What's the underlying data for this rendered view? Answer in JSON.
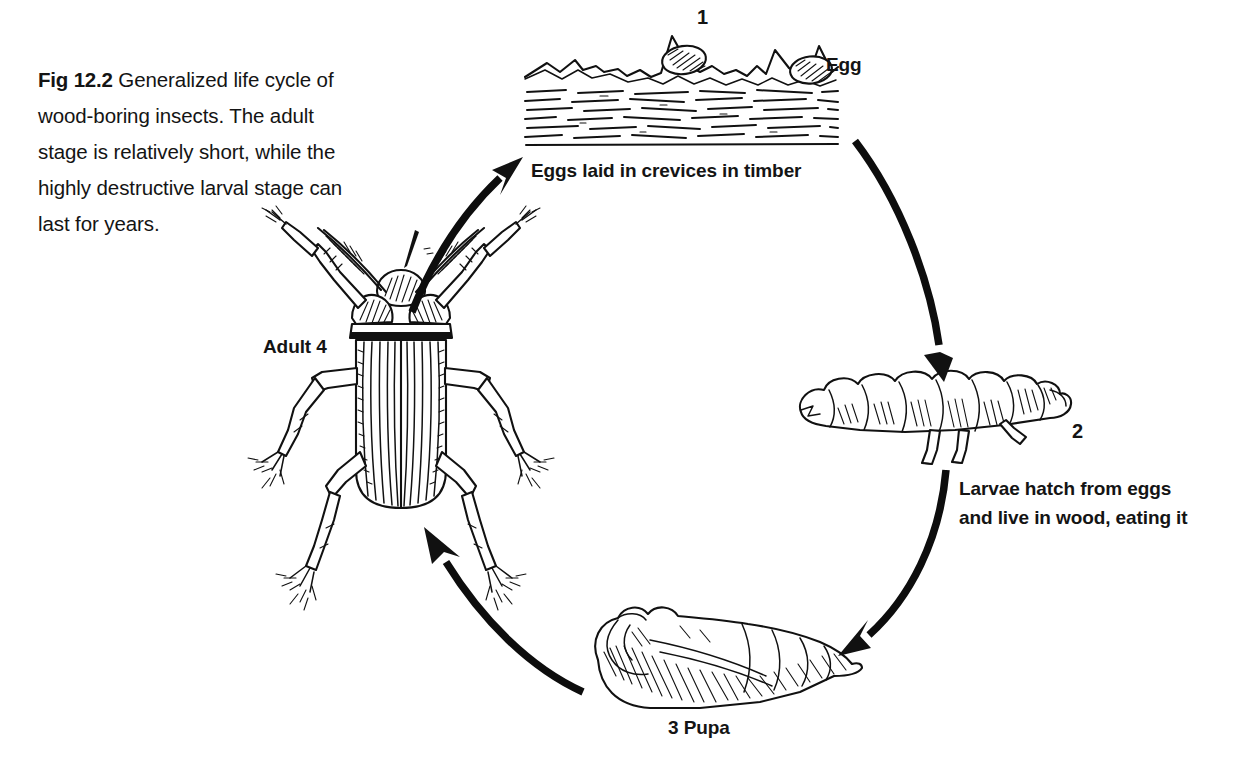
{
  "figure": {
    "caption_number": "Fig 12.2",
    "caption_text": "Generalized life cycle of wood-boring insects. The adult stage is relatively short, while the highly destructive larval stage can last for years.",
    "background_color": "#ffffff",
    "ink_color": "#111111",
    "title": "Generalized life cycle of wood-boring insects"
  },
  "diagram": {
    "type": "cycle",
    "stage_count": 4,
    "stages": [
      {
        "number": "1",
        "name": "Egg",
        "caption": "Eggs laid in crevices in timber",
        "position": "top",
        "illustration": "timber-block-with-eggs"
      },
      {
        "number": "2",
        "name": "Larva",
        "caption": "Larvae hatch from eggs and live in wood, eating it",
        "caption_line_1": "Larvae hatch from eggs",
        "caption_line_2": "and live in wood, eating it",
        "position": "right",
        "illustration": "larva-grub"
      },
      {
        "number": "3",
        "name": "Pupa",
        "caption": "3  Pupa",
        "position": "bottom",
        "illustration": "pupa"
      },
      {
        "number": "4",
        "name": "Adult",
        "caption": "Adult  4",
        "position": "left",
        "illustration": "adult-beetle"
      }
    ],
    "labels": {
      "egg": "Egg",
      "num_1": "1",
      "eggs_laid": "Eggs laid in crevices in timber",
      "num_2": "2",
      "larvae_line_1": "Larvae hatch from eggs",
      "larvae_line_2": "and live in wood, eating it",
      "pupa": "3   Pupa",
      "adult": "Adult   4"
    },
    "arrows": [
      {
        "name": "adult-to-egg",
        "from": "Adult",
        "to": "Egg",
        "direction": "up-right"
      },
      {
        "name": "egg-to-larva",
        "from": "Egg",
        "to": "Larva",
        "direction": "down-right"
      },
      {
        "name": "larva-to-pupa",
        "from": "Larva",
        "to": "Pupa",
        "direction": "down-left"
      },
      {
        "name": "pupa-to-adult",
        "from": "Pupa",
        "to": "Adult",
        "direction": "up-left"
      }
    ]
  }
}
